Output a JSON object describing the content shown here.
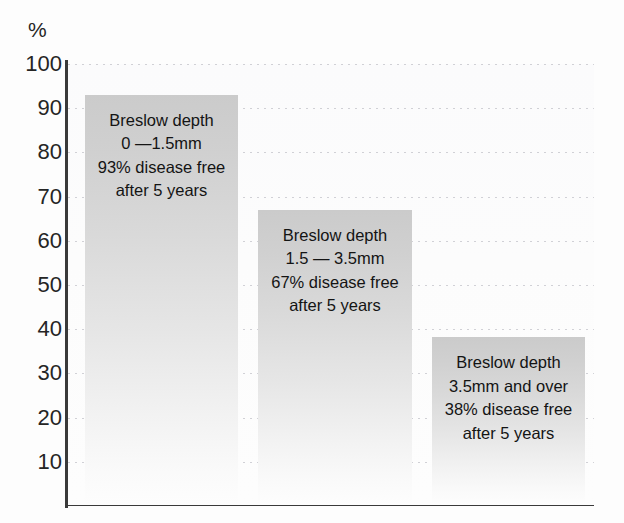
{
  "chart_data": {
    "type": "bar",
    "title": "",
    "subtitle": "",
    "xlabel": "",
    "ylabel": "%",
    "ylim": [
      0,
      100
    ],
    "ytick_labels": [
      "100",
      "90",
      "80",
      "70",
      "60",
      "50",
      "40",
      "30",
      "20",
      "10"
    ],
    "ytick_values": [
      100,
      90,
      80,
      70,
      60,
      50,
      40,
      30,
      20,
      10
    ],
    "grid": true,
    "grid_axis": "y",
    "legend": "none",
    "categories": [
      "0 —1.5mm",
      "1.5 — 3.5mm",
      "3.5mm and over"
    ],
    "values": [
      93,
      67,
      38
    ],
    "series": [
      {
        "name": "5 year disease free survival",
        "values": [
          93,
          67,
          38
        ]
      }
    ],
    "annotations": [
      "Breslow depth 0 —1.5mm 93% disease free after 5 years",
      "Breslow depth 1.5 — 3.5mm 67% disease free after 5 years",
      "Breslow depth 3.5mm and over 38% disease free after 5 years"
    ]
  },
  "axis": {
    "y_unit_label": "%",
    "ticks": [
      {
        "label": "100",
        "value": 100
      },
      {
        "label": "90",
        "value": 90
      },
      {
        "label": "80",
        "value": 80
      },
      {
        "label": "70",
        "value": 70
      },
      {
        "label": "60",
        "value": 60
      },
      {
        "label": "50",
        "value": 50
      },
      {
        "label": "40",
        "value": 40
      },
      {
        "label": "30",
        "value": 30
      },
      {
        "label": "20",
        "value": 20
      },
      {
        "label": "10",
        "value": 10
      }
    ]
  },
  "bars": [
    {
      "value": 93,
      "label_lines": {
        "line1": "Breslow depth",
        "line2": "0 —1.5mm",
        "line3": "93% disease free",
        "line4": "after 5 years"
      }
    },
    {
      "value": 67,
      "label_lines": {
        "line1": "Breslow depth",
        "line2": "1.5 — 3.5mm",
        "line3": "67% disease free",
        "line4": "after 5 years"
      }
    },
    {
      "value": 38,
      "label_lines": {
        "line1": "Breslow depth",
        "line2": "3.5mm and over",
        "line3": "38% disease free",
        "line4": "after 5 years"
      }
    }
  ],
  "colors": {
    "bar_top": "#cbcbcb",
    "bar_bottom": "#fdfdfd",
    "axis": "#3a3a3a",
    "gridline": "#c9c9cf",
    "text": "#141414",
    "background": "#ffffff"
  }
}
